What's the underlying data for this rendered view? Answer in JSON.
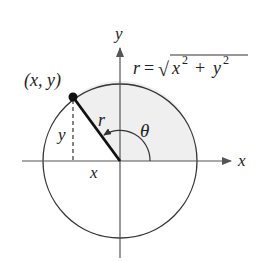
{
  "diagram": {
    "colors": {
      "stroke": "#333333",
      "shade": "#efefef",
      "background": "#ffffff"
    },
    "axes": {
      "x_label": "x",
      "y_label": "y"
    },
    "point": {
      "label": "(x, y)"
    },
    "segments": {
      "radius_label": "r",
      "horizontal_label": "x",
      "vertical_label": "y"
    },
    "angle": {
      "label": "θ"
    },
    "formula": {
      "lhs": "r",
      "equals": "=",
      "radical": "√",
      "x": "x",
      "x_exp": "2",
      "plus": "+",
      "y": "y",
      "y_exp": "2"
    }
  }
}
